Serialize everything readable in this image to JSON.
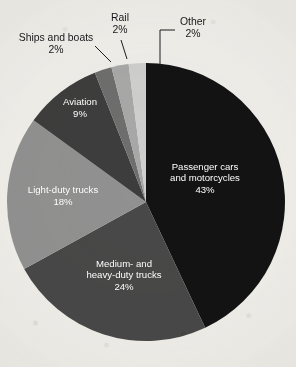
{
  "chart_data": {
    "type": "pie",
    "title": "",
    "subtitle": "",
    "xlabel": "",
    "ylabel": "",
    "legend_position": "none",
    "grid": false,
    "unit": "%",
    "total": 100,
    "start_angle_deg": 0,
    "direction": "clockwise",
    "categories": [
      "Passenger cars and motorcycles",
      "Medium- and heavy-duty trucks",
      "Light-duty trucks",
      "Aviation",
      "Ships and boats",
      "Rail",
      "Other"
    ],
    "values": [
      43,
      24,
      18,
      9,
      2,
      2,
      2
    ],
    "slices": [
      {
        "label_line1": "Passenger cars",
        "label_line2": "and motorcycles",
        "value_label": "43%",
        "value": 43,
        "color": "#131314",
        "label_placement": "inside",
        "label_x": 205,
        "label_y": 178
      },
      {
        "label_line1": "Medium- and",
        "label_line2": "heavy-duty trucks",
        "value_label": "24%",
        "value": 24,
        "color": "#484848",
        "label_placement": "inside",
        "label_x": 124,
        "label_y": 275
      },
      {
        "label_line1": "Light-duty trucks",
        "label_line2": "",
        "value_label": "18%",
        "value": 18,
        "color": "#919191",
        "label_placement": "inside",
        "label_x": 63,
        "label_y": 196
      },
      {
        "label_line1": "Aviation",
        "label_line2": "",
        "value_label": "9%",
        "value": 9,
        "color": "#3d3d3d",
        "label_placement": "inside",
        "label_x": 80,
        "label_y": 108
      },
      {
        "label_line1": "Ships and boats",
        "label_line2": "",
        "value_label": "2%",
        "value": 2,
        "color": "#6e6e6e",
        "label_placement": "callout",
        "label_x": 56,
        "label_y": 44
      },
      {
        "label_line1": "Rail",
        "label_line2": "",
        "value_label": "2%",
        "value": 2,
        "color": "#a8a8a8",
        "label_placement": "callout",
        "label_x": 120,
        "label_y": 24
      },
      {
        "label_line1": "Other",
        "label_line2": "",
        "value_label": "2%",
        "value": 2,
        "color": "#cfcfcf",
        "label_placement": "callout",
        "label_x": 193,
        "label_y": 28
      }
    ],
    "background_color": "#efeeea"
  }
}
